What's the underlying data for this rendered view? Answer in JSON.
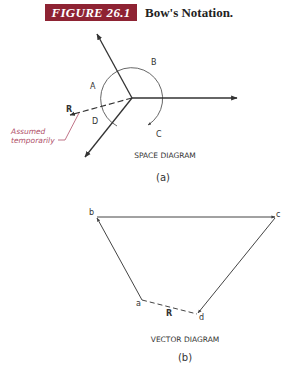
{
  "figure": {
    "number_label": "FIGURE 26.1",
    "title": "Bow's Notation.",
    "banner_color": "#8e2333"
  },
  "space_diagram": {
    "caption": "SPACE DIAGRAM",
    "sublabel": "(a)",
    "region_labels": [
      "A",
      "B",
      "C",
      "D"
    ],
    "resultant_label": "R",
    "annotation": {
      "line1": "Assumed",
      "line2": "temporarily",
      "color": "#b0506a"
    }
  },
  "vector_diagram": {
    "caption": "VECTOR DIAGRAM",
    "sublabel": "(b)",
    "point_labels": [
      "a",
      "b",
      "c",
      "d"
    ],
    "resultant_label": "R"
  }
}
